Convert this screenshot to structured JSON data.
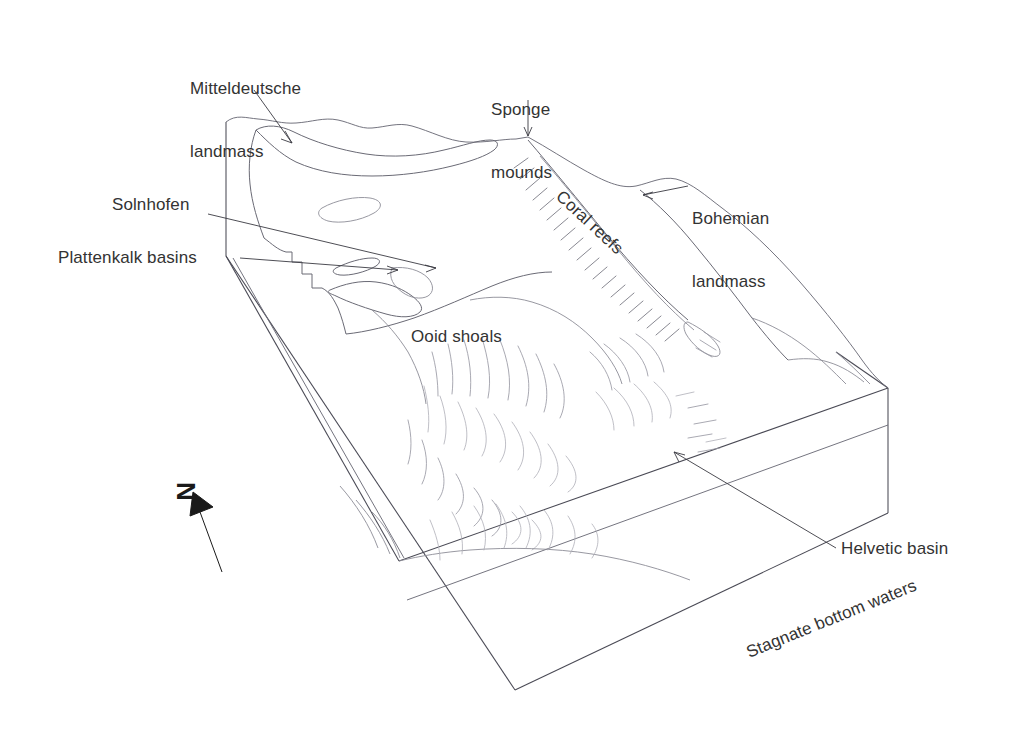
{
  "figure": {
    "type": "block-diagram",
    "background_color": "#ffffff",
    "line_color": "#4a4a55",
    "text_color": "#333333"
  },
  "labels": {
    "mitteldeutsche": "Mitteldeutsche\nlandmass",
    "mitteldeutsche_line1": "Mitteldeutsche",
    "mitteldeutsche_line2": "landmass",
    "sponge_mounds_line1": "Sponge",
    "sponge_mounds_line2": "mounds",
    "bohemian_line1": "Bohemian",
    "bohemian_line2": "landmass",
    "solnhofen": "Solnhofen",
    "plattenkalk": "Plattenkalk basins",
    "ooid_shoals": "Ooid shoals",
    "coral_reefs": "Coral reefs",
    "stagnate": "Stagnate bottom waters",
    "helvetic": "Helvetic basin",
    "north": "N"
  },
  "annotations": [
    {
      "name": "mitteldeutsche-landmass",
      "text": "Mitteldeutsche landmass",
      "leader": "arrow",
      "points_to": "top-left plateau"
    },
    {
      "name": "sponge-mounds",
      "text": "Sponge mounds",
      "leader": "arrow",
      "points_to": "ridge apex"
    },
    {
      "name": "bohemian-landmass",
      "text": "Bohemian landmass",
      "leader": "arrow",
      "points_to": "right ridge"
    },
    {
      "name": "solnhofen",
      "text": "Solnhofen",
      "leader": "arrow",
      "points_to": "small basin left-centre"
    },
    {
      "name": "plattenkalk-basins",
      "text": "Plattenkalk basins",
      "leader": "arrow",
      "points_to": "basin lobes left-centre"
    },
    {
      "name": "ooid-shoals",
      "text": "Ooid shoals",
      "leader": "none",
      "points_to": "central shoal field"
    },
    {
      "name": "coral-reefs",
      "text": "Coral reefs",
      "leader": "none",
      "points_to": "reef belt",
      "rotation_deg": 43
    },
    {
      "name": "stagnate-bottom-waters",
      "text": "Stagnate bottom waters",
      "leader": "none",
      "points_to": "front cross-section face",
      "rotation_deg": -22
    },
    {
      "name": "helvetic-basin",
      "text": "Helvetic basin",
      "leader": "arrow",
      "points_to": "deep basin right-centre"
    }
  ],
  "compass": {
    "label": "N",
    "direction": "up-left",
    "glyph_rotation_deg": 90
  }
}
